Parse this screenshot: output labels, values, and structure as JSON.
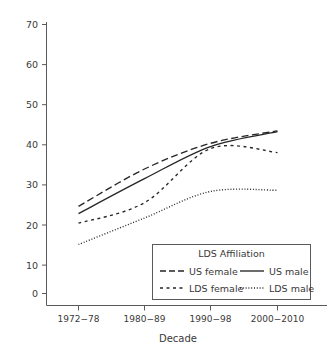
{
  "chart_data": {
    "type": "line",
    "title": "",
    "xlabel": "Decade",
    "ylabel": "",
    "categories": [
      "1972−78",
      "1980−89",
      "1990−98",
      "2000−2010"
    ],
    "x_tick_labels": [
      "1972−78",
      "1980−89",
      "1990−98",
      "2000−2010"
    ],
    "y_tick_labels": [
      "0",
      "10",
      "20",
      "30",
      "40",
      "50",
      "60",
      "70"
    ],
    "y_ticks": [
      0,
      10,
      20,
      30,
      40,
      50,
      60,
      70
    ],
    "ylim": [
      0,
      73
    ],
    "grid": false,
    "legend_position": "bottom-right",
    "legend_title": "LDS Affiliation",
    "series": [
      {
        "name": "US female",
        "dash": "long-dash",
        "values": [
          24.7,
          34.0,
          40.4,
          43.5
        ]
      },
      {
        "name": "US male",
        "dash": "solid",
        "values": [
          22.9,
          31.6,
          39.6,
          43.3
        ]
      },
      {
        "name": "LDS female",
        "dash": "short-dash",
        "values": [
          20.5,
          25.6,
          39.1,
          38.1
        ]
      },
      {
        "name": "LDS male",
        "dash": "dotted",
        "values": [
          15.2,
          21.8,
          28.4,
          28.7
        ]
      }
    ]
  },
  "legend": {
    "title": "LDS Affiliation",
    "entries": [
      {
        "label": "US female",
        "dash": "long-dash"
      },
      {
        "label": "US male",
        "dash": "solid"
      },
      {
        "label": "LDS female",
        "dash": "short-dash"
      },
      {
        "label": "LDS male",
        "dash": "dotted"
      }
    ]
  },
  "axes": {
    "x_title": "Decade",
    "y_title": ""
  },
  "colors": {
    "line": "#262626",
    "axis": "#5a5a5a",
    "text": "#3a3a3a",
    "background": "#ffffff"
  }
}
